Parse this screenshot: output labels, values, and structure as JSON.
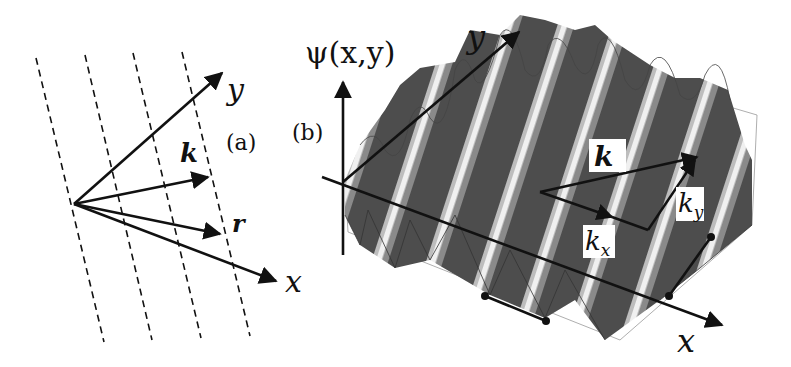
{
  "figure": {
    "panel_a": {
      "label": "(a)",
      "axes": {
        "x": "x",
        "y": "y"
      },
      "vectors": {
        "k": "k",
        "r": "r"
      },
      "wavefront_count": 4,
      "wavefront_style": "dashed"
    },
    "panel_b": {
      "label": "(b)",
      "function_label": "ψ(x,y)",
      "axes": {
        "x": "x",
        "y": "y"
      },
      "vectors": {
        "k": "k",
        "kx": "k",
        "kx_sub": "x",
        "ky": "k",
        "ky_sub": "y"
      },
      "surface": "plane wave ψ(x,y) rendered as grayscale 3D surface",
      "wavelength_markers": 2
    },
    "colors": {
      "ink": "#111111",
      "surface_dark": "#4a4a4a",
      "surface_light": "#e8e8e8",
      "background": "#ffffff"
    }
  }
}
